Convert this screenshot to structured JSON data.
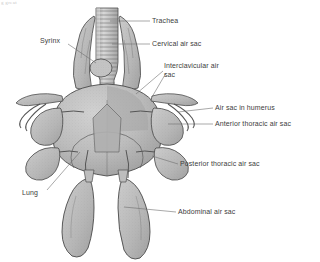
{
  "figure": {
    "kind": "anatomical-diagram",
    "style": "grayscale stipple line drawing",
    "corner_fragment": "g great",
    "colors": {
      "background": "#ffffff",
      "tissue_fill": "#b9b9b9",
      "tissue_fill_light": "#c9c9c9",
      "tissue_fill_dark": "#a3a3a3",
      "outline": "#4a4a4a",
      "label_text": "#3d3d3d",
      "leader_line": "#6e6e6e"
    }
  },
  "labels": [
    {
      "id": "trachea",
      "text": "Trachea",
      "side": "right",
      "x": 152,
      "y": 17
    },
    {
      "id": "cervical-air-sac",
      "text": "Cervical air sac",
      "side": "right",
      "x": 152,
      "y": 40
    },
    {
      "id": "interclavicular-air-sac",
      "text": "Interclavicular air sac",
      "side": "right",
      "x": 164,
      "y": 62
    },
    {
      "id": "air-sac-in-humerus",
      "text": "Air sac in humerus",
      "side": "right",
      "x": 215,
      "y": 104
    },
    {
      "id": "anterior-thoracic-air-sac",
      "text": "Anterior thoracic air sac",
      "side": "right",
      "x": 215,
      "y": 120
    },
    {
      "id": "posterior-thoracic-air-sac",
      "text": "Posterior thoracic air sac",
      "side": "right",
      "x": 180,
      "y": 160
    },
    {
      "id": "abdominal-air-sac",
      "text": "Abdominal air sac",
      "side": "right",
      "x": 178,
      "y": 208
    },
    {
      "id": "syrinx",
      "text": "Syrinx",
      "side": "left",
      "x": 40,
      "y": 37
    },
    {
      "id": "lung",
      "text": "Lung",
      "side": "left",
      "x": 22,
      "y": 189
    }
  ],
  "leaders": [
    {
      "id": "leader-trachea",
      "points": "110,21 150,21"
    },
    {
      "id": "leader-cervical",
      "points": "110,44 150,44"
    },
    {
      "id": "leader-interclavicular-a",
      "points": "136,93 162,72"
    },
    {
      "id": "leader-interclavicular-b",
      "points": "152,95 166,74"
    },
    {
      "id": "leader-humerus",
      "points": "176,112 213,108"
    },
    {
      "id": "leader-anterior-thoracic",
      "points": "166,122 213,124"
    },
    {
      "id": "leader-posterior-thoracic",
      "points": "152,152 178,164"
    },
    {
      "id": "leader-abdominal",
      "points": "124,207 176,212"
    },
    {
      "id": "leader-syrinx",
      "points": "68,44 96,62"
    },
    {
      "id": "leader-lung",
      "points": "46,190 80,152"
    }
  ],
  "structures": [
    {
      "id": "trachea",
      "label": "Trachea",
      "count": 1
    },
    {
      "id": "syrinx",
      "label": "Syrinx",
      "count": 1
    },
    {
      "id": "cervical-air-sac",
      "label": "Cervical air sac",
      "count": 2
    },
    {
      "id": "interclavicular-air-sac",
      "label": "Interclavicular air sac",
      "count": 1
    },
    {
      "id": "air-sac-in-humerus",
      "label": "Air sac in humerus",
      "count": 2
    },
    {
      "id": "anterior-thoracic-air-sac",
      "label": "Anterior thoracic air sac",
      "count": 2
    },
    {
      "id": "posterior-thoracic-air-sac",
      "label": "Posterior thoracic air sac",
      "count": 2
    },
    {
      "id": "abdominal-air-sac",
      "label": "Abdominal air sac",
      "count": 2
    },
    {
      "id": "lung",
      "label": "Lung",
      "count": 2
    }
  ]
}
